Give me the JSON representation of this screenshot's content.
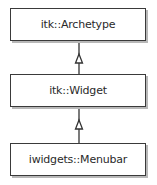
{
  "diagram": {
    "type": "uml-class-inheritance",
    "classes": [
      {
        "id": "archetype",
        "label": "itk::Archetype"
      },
      {
        "id": "widget",
        "label": "itk::Widget"
      },
      {
        "id": "menubar",
        "label": "iwidgets::Menubar"
      }
    ],
    "relations": [
      {
        "from": "widget",
        "to": "archetype",
        "kind": "generalization"
      },
      {
        "from": "menubar",
        "to": "widget",
        "kind": "generalization"
      }
    ],
    "colors": {
      "border": "#3a3a3a",
      "shadow": "#b8b8b8",
      "text": "#2a2a2a",
      "background": "#ffffff"
    }
  }
}
